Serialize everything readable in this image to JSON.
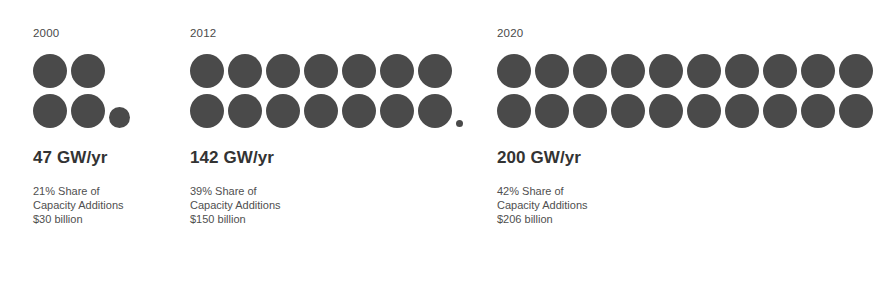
{
  "chart_data": {
    "type": "pictogram",
    "title": "",
    "unit_note": "each full circle represents approximately 10 GW/yr",
    "categories": [
      "2000",
      "2012",
      "2020"
    ],
    "values": [
      47,
      142,
      200
    ],
    "ylabel": "GW/yr",
    "series": [
      {
        "name": "Annual capacity additions (GW/yr)",
        "values": [
          47,
          142,
          200
        ]
      },
      {
        "name": "Share of capacity additions (%)",
        "values": [
          21,
          39,
          42
        ]
      },
      {
        "name": "Investment (USD billion)",
        "values": [
          30,
          150,
          206
        ]
      }
    ]
  },
  "theme": {
    "dot_color": "#4a4a4a",
    "headline_color": "#333333",
    "text_color": "#4f4f4f",
    "background": "#ffffff"
  },
  "groups": [
    {
      "year": "2000",
      "headline": "47 GW/yr",
      "share_line": "21% Share of",
      "additions_line": "Capacity Additions",
      "investment_line": "$30 billion",
      "rows": [
        [
          "full",
          "full"
        ],
        [
          "full",
          "full",
          "mid"
        ]
      ]
    },
    {
      "year": "2012",
      "headline": "142 GW/yr",
      "share_line": "39% Share of",
      "additions_line": "Capacity Additions",
      "investment_line": "$150 billion",
      "rows": [
        [
          "full",
          "full",
          "full",
          "full",
          "full",
          "full",
          "full"
        ],
        [
          "full",
          "full",
          "full",
          "full",
          "full",
          "full",
          "full",
          "tiny"
        ]
      ]
    },
    {
      "year": "2020",
      "headline": "200 GW/yr",
      "share_line": "42% Share of",
      "additions_line": "Capacity Additions",
      "investment_line": "$206 billion",
      "rows": [
        [
          "full",
          "full",
          "full",
          "full",
          "full",
          "full",
          "full",
          "full",
          "full",
          "full"
        ],
        [
          "full",
          "full",
          "full",
          "full",
          "full",
          "full",
          "full",
          "full",
          "full",
          "full"
        ]
      ]
    }
  ]
}
